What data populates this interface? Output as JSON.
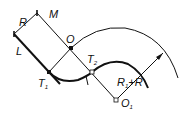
{
  "diagram": {
    "title": "",
    "colors": {
      "line": "#111111",
      "background": "#ffffff"
    },
    "labels": {
      "R": "R",
      "M": "M",
      "L": "L",
      "O": "O",
      "T1": "T",
      "T1_sub": "1",
      "T2": "T",
      "T2_sub": "2",
      "O1": "O",
      "O1_sub": "1",
      "R1R_a": "R",
      "R1R_sub": "1",
      "R1R_b": "+R"
    },
    "points": {
      "top": [
        37,
        13
      ],
      "left": [
        14,
        34
      ],
      "O": [
        71,
        48
      ],
      "T1": [
        49,
        72
      ],
      "T2": [
        92,
        72
      ],
      "O1": [
        116,
        100
      ],
      "arrow_tip": [
        163,
        53
      ]
    }
  }
}
